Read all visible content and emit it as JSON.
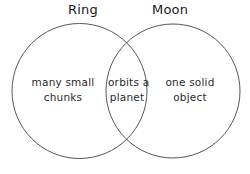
{
  "diagram": {
    "type": "venn-two-set",
    "background_color": "#ffffff",
    "stroke_color": "#565656",
    "text_color": "#2b2b2b",
    "label_color": "#1a1a1a",
    "sets": [
      {
        "id": "ring",
        "label": "Ring",
        "unique_text_lines": [
          "many small",
          "chunks"
        ]
      },
      {
        "id": "moon",
        "label": "Moon",
        "unique_text_lines": [
          "one solid",
          "object"
        ]
      }
    ],
    "intersection": {
      "id": "ring-and-moon",
      "text_lines": [
        "orbits a",
        "planet"
      ]
    }
  }
}
